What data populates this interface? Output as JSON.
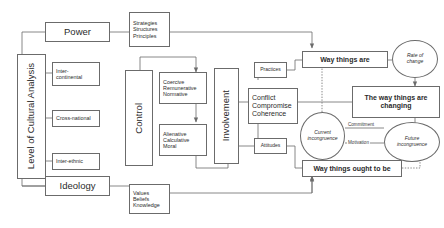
{
  "diagram": {
    "stroke_color": "#6b6b6b",
    "text_color": "#2b2b2b",
    "background": "#ffffff"
  },
  "nodes": {
    "power": {
      "label": "Power"
    },
    "strategies": {
      "line1": "Strategies",
      "line2": "Structures",
      "line3": "Principles"
    },
    "level_of_cultural_analysis": {
      "label": "Level of Cultural Analysis"
    },
    "inter_continental": {
      "line1": "Inter-",
      "line2": "continental"
    },
    "cross_national": {
      "label": "Cross-national"
    },
    "inter_ethnic": {
      "label": "Inter-ethnic"
    },
    "ideology": {
      "label": "Ideology"
    },
    "values": {
      "line1": "Values",
      "line2": "Beliefs",
      "line3": "Knowledge"
    },
    "control": {
      "label": "Control"
    },
    "coercive": {
      "line1": "Coercive",
      "line2": "Remunerative",
      "line3": "Normative"
    },
    "alienative": {
      "line1": "Alienative",
      "line2": "Calculative",
      "line3": "Moral"
    },
    "involvement": {
      "label": "Involvement"
    },
    "practices": {
      "label": "Practices"
    },
    "conflict": {
      "line1": "Conflict",
      "line2": "Compromise",
      "line3": "Coherence"
    },
    "attitudes": {
      "label": "Attitudes"
    },
    "way_things_are": {
      "label": "Way things are"
    },
    "way_things_ought": {
      "label": "Way things ought to be"
    },
    "way_things_changing": {
      "line1": "The way things are",
      "line2": "changing"
    },
    "rate_of_change": {
      "line1": "Rate of",
      "line2": "change"
    },
    "current_incongruence": {
      "line1": "Current",
      "line2": "incongruence"
    },
    "future_incongruence": {
      "line1": "Future",
      "line2": "incongruence"
    }
  },
  "edge_labels": {
    "commitment": "Commitment",
    "motivation": "Motivation"
  }
}
